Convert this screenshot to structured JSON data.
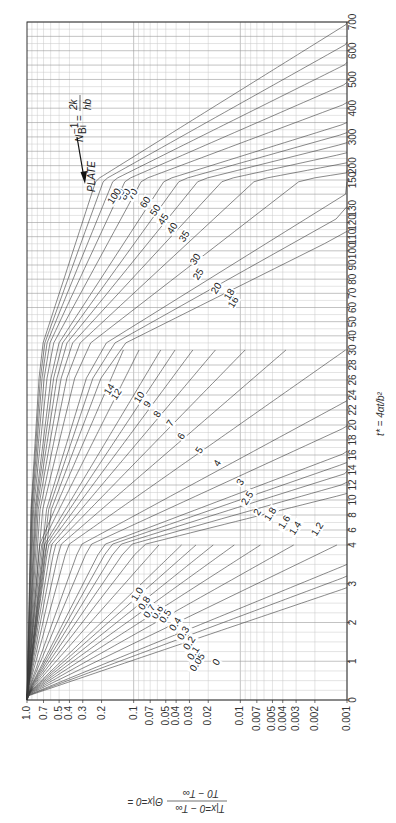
{
  "chart_data": {
    "type": "line",
    "title": "PLATE",
    "subtitle": "Midplane temperature chart (Heisler chart), rotated 90°",
    "parameter_label": "N_Bi^-1 = 2k / hb",
    "xlabel": "t* = 4αt/b²",
    "ylabel": "Θ|x=0 = (T|x=0 − T∞) / (T0 − T∞)",
    "x_scale": "piecewise linear",
    "y_scale": "log",
    "xlim": [
      0,
      700
    ],
    "ylim": [
      0.001,
      1.0
    ],
    "grid": true,
    "x_ticks": [
      "0",
      "1",
      "2",
      "3",
      "4",
      "6",
      "8",
      "10",
      "12",
      "14",
      "16",
      "18",
      "20",
      "22",
      "24",
      "26",
      "28",
      "30",
      "40",
      "50",
      "60",
      "70",
      "80",
      "90",
      "100",
      "110",
      "120",
      "130",
      "150",
      "200",
      "300",
      "400",
      "500",
      "600",
      "700"
    ],
    "y_ticks": [
      "1.0",
      "0.7",
      "0.5",
      "0.4",
      "0.3",
      "0.2",
      "0.1",
      "0.07",
      "0.05",
      "0.04",
      "0.03",
      "0.02",
      "0.01",
      "0.007",
      "0.005",
      "0.004",
      "0.003",
      "0.002",
      "0.001"
    ],
    "series_labels": [
      "0",
      "0.05",
      "0.1",
      "0.2",
      "0.3",
      "0.4",
      "0.5",
      "0.6",
      "0.7",
      "0.8",
      "1.0",
      "1.2",
      "1.4",
      "1.6",
      "1.8",
      "2",
      "2.5",
      "3",
      "4",
      "5",
      "6",
      "7",
      "8",
      "9",
      "10",
      "12",
      "14",
      "16",
      "18",
      "20",
      "25",
      "30",
      "35",
      "40",
      "45",
      "50",
      "60",
      "70",
      "80",
      "90",
      "100"
    ],
    "series_groups": [
      {
        "range_t": [
          0,
          4
        ],
        "labels": [
          "0",
          "0.05",
          "0.1",
          "0.2",
          "0.3",
          "0.4",
          "0.5",
          "0.6",
          "0.7",
          "0.8",
          "1.0"
        ]
      },
      {
        "range_t": [
          0,
          30
        ],
        "labels": [
          "1.2",
          "1.4",
          "1.6",
          "1.8",
          "2",
          "2.5",
          "3",
          "4",
          "5",
          "6",
          "7",
          "8",
          "9",
          "10",
          "12",
          "14"
        ]
      },
      {
        "range_t": [
          0,
          700
        ],
        "labels": [
          "16",
          "18",
          "20",
          "25",
          "30",
          "35",
          "40",
          "45",
          "50",
          "60",
          "70",
          "80",
          "90",
          "100"
        ]
      }
    ],
    "annotation": "arrow pointing to the curve family labelled by N_Bi^-1"
  },
  "labels": {
    "plate": "PLATE",
    "param": "N",
    "param_sub": "Bi",
    "param_sup": "−1",
    "param_eq": "=",
    "param_num": "2k",
    "param_den": "hb",
    "x_title": "t* = 4αt/b²",
    "y_title_lhs": "Θ|x=0 =",
    "y_title_num": "T|x=0 − T∞",
    "y_title_den": "T0 − T∞"
  }
}
